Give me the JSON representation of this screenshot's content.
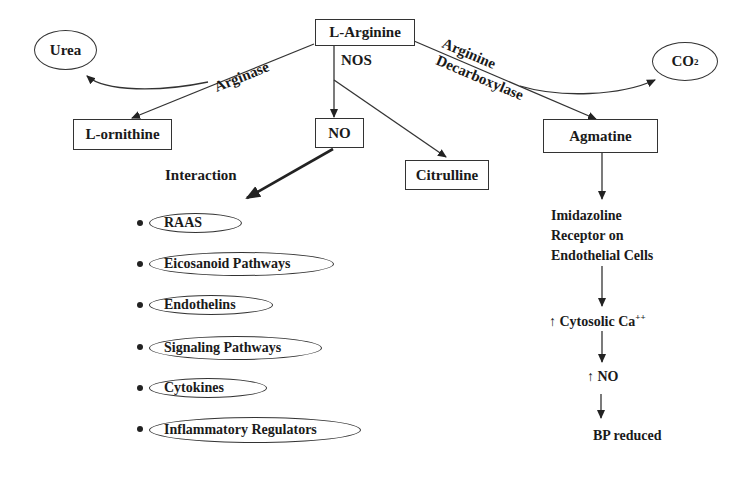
{
  "diagram": {
    "nodes": {
      "arginine": "L-Arginine",
      "urea": "Urea",
      "co2_main": "CO",
      "co2_sub": "2",
      "ornithine": "L-ornithine",
      "no": "NO",
      "citrulline": "Citrulline",
      "agmatine": "Agmatine"
    },
    "edges": {
      "arginase": "Arginase",
      "nos": "NOS",
      "decarboxylase_line1": "Arginine",
      "decarboxylase_line2": "Decarboxylase",
      "interaction": "Interaction"
    },
    "interactions": [
      "RAAS",
      "Eicosanoid Pathways",
      "Endothelins",
      "Signaling Pathways",
      "Cytokines",
      "Inflammatory Regulators"
    ],
    "agmatine_chain": {
      "receptor_line1": "Imidazoline",
      "receptor_line2": "Receptor on",
      "receptor_line3": "Endothelial Cells",
      "calcium": "↑ Cytosolic Ca",
      "calcium_sup": "++",
      "no_up": "↑ NO",
      "bp": "BP reduced"
    }
  }
}
